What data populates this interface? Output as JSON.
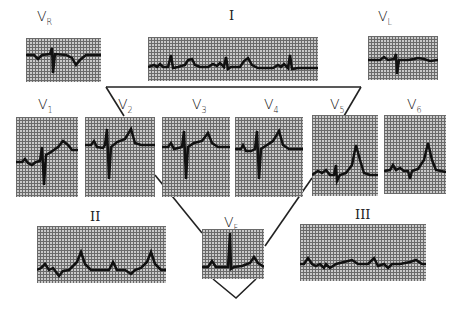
{
  "figure": {
    "colors": {
      "grid": "#6a6a6a",
      "paper": "#c9c9c9",
      "trace": "#111111",
      "lines": "#222222"
    }
  },
  "leads": {
    "vr": {
      "letter": "V",
      "sub": "R"
    },
    "i": {
      "label": "I"
    },
    "vl": {
      "letter": "V",
      "sub": "L"
    },
    "v1": {
      "letter": "V",
      "sub": "1"
    },
    "v2": {
      "letter": "V",
      "sub": "2"
    },
    "v3": {
      "letter": "V",
      "sub": "3"
    },
    "v4": {
      "letter": "V",
      "sub": "4"
    },
    "v5": {
      "letter": "V",
      "sub": "5"
    },
    "v6": {
      "letter": "V",
      "sub": "6"
    },
    "ii": {
      "label": "II"
    },
    "vf": {
      "letter": "V",
      "sub": "F"
    },
    "iii": {
      "label": "III"
    }
  }
}
